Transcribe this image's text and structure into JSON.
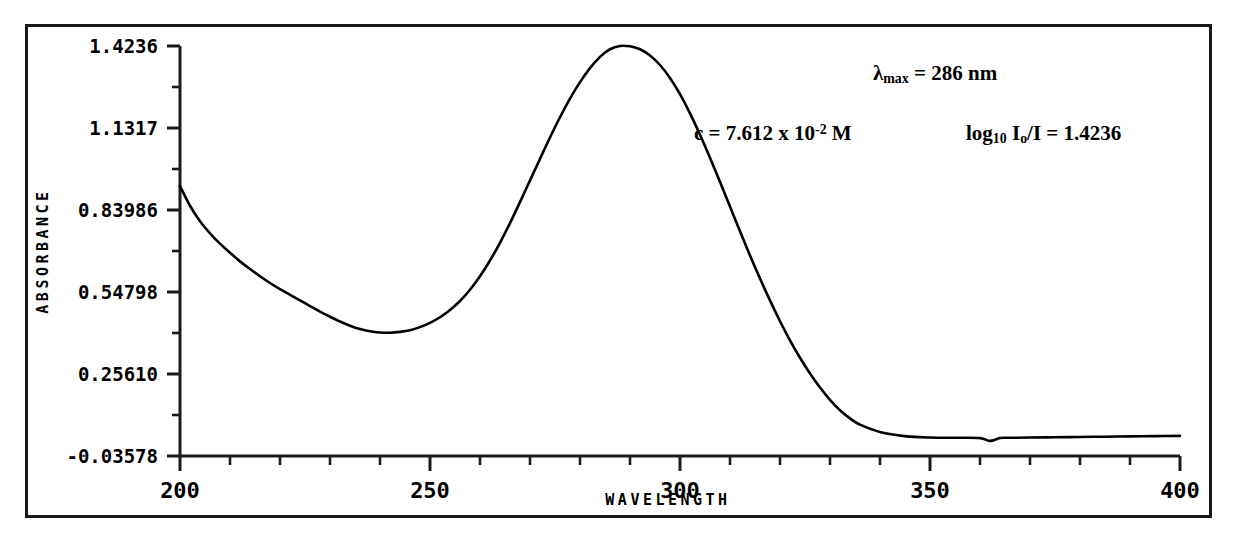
{
  "chart_data": {
    "type": "line",
    "title": "",
    "xlabel": "WAVELENGTH",
    "ylabel": "ABSORBANCE",
    "xlim": [
      200,
      400
    ],
    "ylim": [
      -0.03578,
      1.4236
    ],
    "grid": false,
    "legend_position": "none",
    "x_ticks": [
      200,
      250,
      300,
      350,
      400
    ],
    "x_tick_labels": [
      "200",
      "250",
      "300",
      "350",
      "400"
    ],
    "x_minor_tick_interval": 10,
    "y_ticks": [
      1.4236,
      1.1317,
      0.83986,
      0.54798,
      0.2561,
      -0.03578
    ],
    "y_tick_labels": [
      "1.4236",
      "1.1317",
      "0.83986",
      "0.54798",
      "0.25610",
      "-0.03578"
    ],
    "y_minor_ticks": [
      1.27775,
      0.98578,
      0.69392,
      0.40204,
      0.11016
    ],
    "series": [
      {
        "name": "absorbance",
        "color": "#000000",
        "x": [
          200,
          202,
          204,
          206,
          208,
          210,
          212,
          214,
          216,
          218,
          220,
          222,
          224,
          226,
          228,
          230,
          232,
          234,
          236,
          238,
          240,
          242,
          244,
          246,
          248,
          250,
          252,
          254,
          256,
          258,
          260,
          262,
          264,
          266,
          268,
          270,
          272,
          274,
          276,
          278,
          280,
          282,
          284,
          286,
          288,
          290,
          292,
          294,
          296,
          298,
          300,
          302,
          304,
          306,
          308,
          310,
          312,
          314,
          316,
          318,
          320,
          322,
          324,
          326,
          328,
          330,
          332,
          334,
          336,
          340,
          345,
          350,
          355,
          360,
          362,
          364,
          366,
          370,
          375,
          380,
          385,
          390,
          395,
          400
        ],
        "y": [
          0.925,
          0.855,
          0.8,
          0.757,
          0.72,
          0.688,
          0.657,
          0.63,
          0.604,
          0.58,
          0.558,
          0.538,
          0.518,
          0.498,
          0.478,
          0.46,
          0.443,
          0.428,
          0.416,
          0.408,
          0.404,
          0.403,
          0.406,
          0.412,
          0.423,
          0.438,
          0.458,
          0.484,
          0.516,
          0.556,
          0.604,
          0.66,
          0.723,
          0.793,
          0.868,
          0.945,
          1.022,
          1.098,
          1.17,
          1.236,
          1.295,
          1.345,
          1.385,
          1.412,
          1.4236,
          1.4225,
          1.412,
          1.39,
          1.356,
          1.31,
          1.252,
          1.184,
          1.108,
          1.026,
          0.94,
          0.852,
          0.764,
          0.678,
          0.596,
          0.518,
          0.444,
          0.376,
          0.314,
          0.258,
          0.208,
          0.164,
          0.127,
          0.098,
          0.076,
          0.05,
          0.035,
          0.03,
          0.029,
          0.028,
          0.018,
          0.028,
          0.029,
          0.03,
          0.031,
          0.032,
          0.033,
          0.034,
          0.035,
          0.036
        ]
      }
    ],
    "annotations": [
      {
        "id": "lambda_max",
        "text": "λmax = 286 nm",
        "lambda_symbol": "λ",
        "subscript": "max",
        "value": "= 286 nm"
      },
      {
        "id": "concentration",
        "text": "c = 7.612 x 10-2 M",
        "prefix": "c = 7.612 x 10",
        "exponent": "-2",
        "suffix": " M"
      },
      {
        "id": "log_ratio",
        "text": "log10 Io/I = 1.4236",
        "prefix": "log",
        "sub1": "10",
        "mid": " I",
        "sub2": "o",
        "suffix": "/I = 1.4236"
      }
    ]
  },
  "axis": {
    "y_title": "ABSORBANCE",
    "x_title": "WAVELENGTH"
  },
  "colors": {
    "line": "#000000",
    "axis": "#1a1a1a",
    "background": "#ffffff"
  }
}
